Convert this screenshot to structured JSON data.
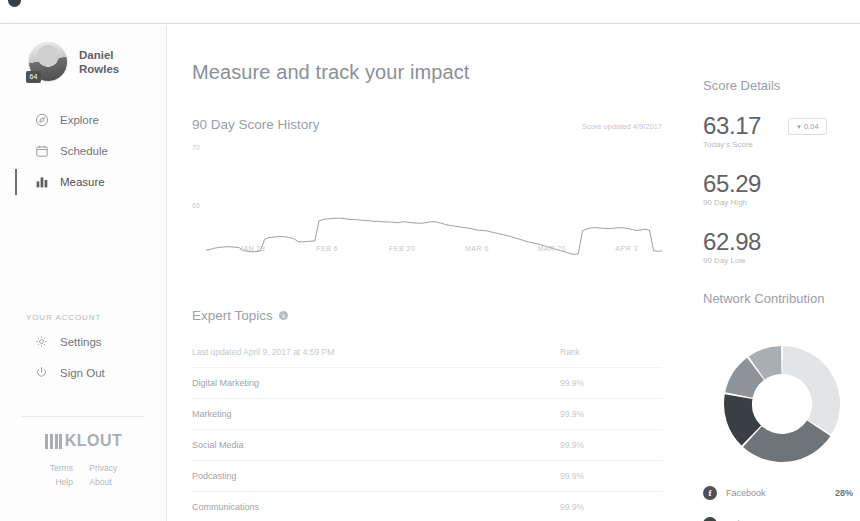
{
  "topbar": {
    "center_text": ""
  },
  "sidebar": {
    "profile": {
      "first_name": "Daniel",
      "last_name": "Rowles",
      "score_badge": "64"
    },
    "nav": [
      {
        "label": "Explore",
        "icon": "compass-icon",
        "active": false
      },
      {
        "label": "Schedule",
        "icon": "calendar-icon",
        "active": false
      },
      {
        "label": "Measure",
        "icon": "bar-chart-icon",
        "active": true
      }
    ],
    "account_section_label": "YOUR ACCOUNT",
    "account_items": [
      {
        "label": "Settings",
        "icon": "gear-icon"
      },
      {
        "label": "Sign Out",
        "icon": "power-icon"
      }
    ],
    "brand": {
      "name": "KLOUT"
    },
    "footer_links": [
      "Terms",
      "Privacy",
      "Help",
      "About"
    ]
  },
  "main": {
    "page_title": "Measure and track your impact",
    "score_history": {
      "title": "90 Day Score History",
      "updated": "Score updated 4/9/2017"
    },
    "topics": {
      "title": "Expert Topics",
      "last_updated": "Last updated April 9, 2017 at 4:59 PM",
      "rank_header": "Rank",
      "rows": [
        {
          "name": "Digital Marketing",
          "rank": "99.9%"
        },
        {
          "name": "Marketing",
          "rank": "99.9%"
        },
        {
          "name": "Social Media",
          "rank": "99.9%"
        },
        {
          "name": "Podcasting",
          "rank": "99.9%"
        },
        {
          "name": "Communications",
          "rank": "99.9%"
        }
      ]
    }
  },
  "rail": {
    "score_details": {
      "title": "Score Details",
      "today": {
        "value": "63.17",
        "label": "Today's Score"
      },
      "delta": {
        "arrow": "▼",
        "value": "0.04"
      },
      "high": {
        "value": "65.29",
        "label": "90 Day High"
      },
      "low": {
        "value": "62.98",
        "label": "90 Day Low"
      }
    },
    "network": {
      "title": "Network Contribution",
      "legend": [
        {
          "name": "Facebook",
          "pct": "28%",
          "icon": "facebook-icon",
          "color": "#4d5156"
        },
        {
          "name": "Twitter",
          "pct": "34%",
          "icon": "twitter-icon",
          "color": "#3f4449"
        }
      ]
    }
  },
  "chart_data": [
    {
      "type": "line",
      "title": "90 Day Score History",
      "xlabel": "",
      "ylabel": "",
      "ylim": [
        62.5,
        70
      ],
      "yticks": [
        "70",
        "65"
      ],
      "xticks": [
        "JAN 23",
        "FEB 6",
        "FEB 20",
        "MAR 6",
        "MAR 20",
        "APR 3"
      ],
      "grid": false,
      "line_color": "#9aa0a6",
      "values": [
        63.25,
        63.3,
        63.38,
        63.42,
        63.45,
        63.47,
        63.46,
        63.44,
        63.4,
        63.22,
        63.18,
        63.15,
        63.16,
        63.2,
        63.95,
        64.05,
        64.08,
        64.1,
        64.12,
        64.1,
        64.06,
        63.98,
        63.8,
        63.78,
        63.8,
        63.82,
        63.84,
        65.12,
        65.2,
        65.24,
        65.26,
        65.28,
        65.29,
        65.26,
        65.22,
        65.2,
        65.18,
        65.16,
        65.14,
        65.12,
        65.1,
        65.08,
        65.06,
        65.05,
        65.04,
        65.02,
        65.0,
        65.06,
        65.04,
        65.0,
        64.98,
        64.96,
        64.98,
        65.02,
        65.06,
        65.04,
        64.98,
        64.9,
        64.84,
        64.8,
        64.76,
        64.72,
        64.68,
        64.64,
        64.58,
        64.52,
        64.5,
        64.48,
        64.42,
        64.36,
        64.3,
        64.24,
        64.18,
        64.1,
        64.02,
        63.94,
        63.86,
        63.78,
        63.72,
        63.66,
        63.6,
        63.52,
        63.44,
        63.36,
        63.28,
        63.2,
        63.12,
        63.04,
        62.98,
        63.02,
        64.48,
        64.6,
        64.66,
        64.68,
        64.66,
        64.64,
        64.62,
        64.64,
        64.66,
        64.68,
        64.66,
        64.62,
        64.56,
        64.5,
        64.54,
        64.58,
        64.52,
        63.22,
        63.18,
        63.2
      ]
    },
    {
      "type": "pie",
      "title": "Network Contribution",
      "donut": true,
      "labels": [
        "Twitter",
        "Facebook",
        "Instagram",
        "LinkedIn",
        "YouTube"
      ],
      "values": [
        34,
        28,
        16,
        12,
        10
      ],
      "colors": [
        "#e2e4e6",
        "#6f7479",
        "#3a3f44",
        "#8e9398",
        "#a9aeb3"
      ],
      "legend_position": "bottom"
    }
  ]
}
